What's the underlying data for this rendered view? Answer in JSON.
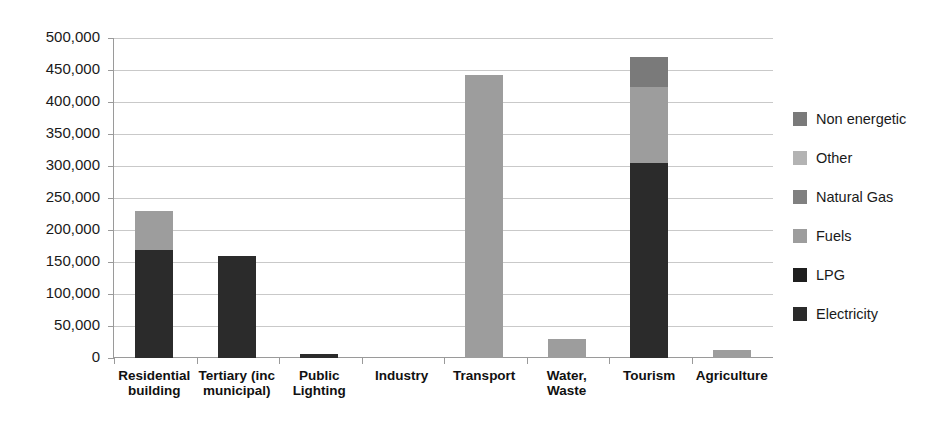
{
  "chart_data": {
    "type": "bar",
    "stacked": true,
    "title": "",
    "xlabel": "",
    "ylabel": "",
    "ylim": [
      0,
      500000
    ],
    "grid": true,
    "legend_position": "right",
    "categories": [
      "Residential\nbuilding",
      "Tertiary (inc\nmunicipal)",
      "Public\nLighting",
      "Industry",
      "Transport",
      "Water,\nWaste",
      "Tourism",
      "Agriculture"
    ],
    "ytick_labels": [
      "0",
      "50,000",
      "100,000",
      "150,000",
      "200,000",
      "250,000",
      "300,000",
      "350,000",
      "400,000",
      "450,000",
      "500,000"
    ],
    "ytick_values": [
      0,
      50000,
      100000,
      150000,
      200000,
      250000,
      300000,
      350000,
      400000,
      450000,
      500000
    ],
    "series": [
      {
        "name": "Electricity",
        "color": "#2b2b2b",
        "values": [
          168000,
          160000,
          5500,
          0,
          0,
          0,
          305000,
          0
        ]
      },
      {
        "name": "LPG",
        "color": "#1f1f1f",
        "values": [
          0,
          0,
          0,
          0,
          0,
          0,
          0,
          0
        ]
      },
      {
        "name": "Fuels",
        "color": "#9d9d9d",
        "values": [
          62000,
          0,
          0,
          0,
          442000,
          30000,
          118000,
          12000
        ]
      },
      {
        "name": "Natural Gas",
        "color": "#808080",
        "values": [
          0,
          0,
          0,
          0,
          0,
          0,
          0,
          0
        ]
      },
      {
        "name": "Other",
        "color": "#b3b3b3",
        "values": [
          0,
          0,
          0,
          0,
          0,
          0,
          0,
          0
        ]
      },
      {
        "name": "Non energetic",
        "color": "#7a7a7a",
        "values": [
          0,
          0,
          0,
          0,
          0,
          0,
          47000,
          0
        ]
      }
    ]
  },
  "legend": {
    "items": [
      {
        "label": "Non energetic",
        "color": "#7a7a7a"
      },
      {
        "label": "Other",
        "color": "#b3b3b3"
      },
      {
        "label": "Natural Gas",
        "color": "#808080"
      },
      {
        "label": "Fuels",
        "color": "#9d9d9d"
      },
      {
        "label": "LPG",
        "color": "#1f1f1f"
      },
      {
        "label": "Electricity",
        "color": "#2b2b2b"
      }
    ]
  },
  "axis": {
    "grid_color": "#c9c9c9",
    "axis_color": "#9a9a9a"
  }
}
